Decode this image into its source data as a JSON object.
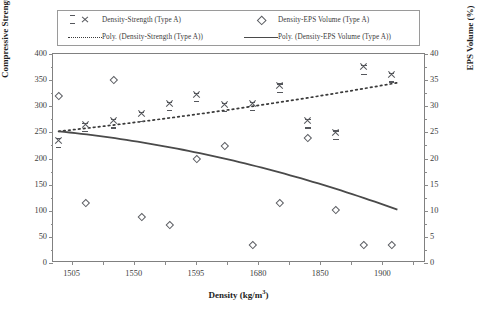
{
  "legend": {
    "entries": [
      {
        "symbol": "x-marker",
        "label": "Density-Strength (Type A)"
      },
      {
        "symbol": "diamond-marker",
        "label": "Density-EPS Volume (Type A)"
      },
      {
        "symbol": "dotted-line",
        "label": "Poly. (Density-Strength (Type A))"
      },
      {
        "symbol": "solid-line",
        "label": "Poly. (Density-EPS Volume (Type A))"
      }
    ]
  },
  "axes": {
    "left_title_main": "Compressive Strength (kg/cm",
    "left_title_sup": "2",
    "left_title_tail": ")",
    "right_title": "EPS Volume (%)",
    "x_title_main": "Density (kg/m",
    "x_title_sup": "3",
    "x_title_tail": ")",
    "left_ticks": [
      "0",
      "50",
      "100",
      "150",
      "200",
      "250",
      "300",
      "350",
      "400"
    ],
    "right_ticks": [
      "0",
      "5",
      "10",
      "15",
      "20",
      "25",
      "30",
      "35",
      "40"
    ],
    "x_tick_labels": [
      "1505",
      "1550",
      "1595",
      "1680",
      "1850",
      "1900"
    ]
  },
  "chart_data": {
    "type": "scatter",
    "title": "",
    "xlabel": "Density (kg/m3)",
    "ylabel": "Compressive Strength (kg/cm2)",
    "y2label": "EPS Volume (%)",
    "xlim": [
      0,
      12
    ],
    "ylim": [
      0,
      400
    ],
    "y2lim": [
      0,
      40
    ],
    "grid": false,
    "legend_position": "top",
    "x_categories": [
      "1505",
      "1520",
      "1550",
      "1565",
      "1595",
      "1625",
      "1680",
      "1750",
      "1850",
      "1875",
      "1900",
      "1930"
    ],
    "x_tick_labels_shown": [
      "1505",
      "1550",
      "1595",
      "1680",
      "1850",
      "1900"
    ],
    "series": [
      {
        "name": "Density-Strength (Type A)",
        "marker": "x-marker",
        "axis": "left",
        "x": [
          0.18,
          1.04,
          1.95,
          2.85,
          3.75,
          4.62,
          5.52,
          6.42,
          7.3,
          8.2,
          9.1,
          10.0
        ],
        "values": [
          235,
          265,
          272,
          285,
          305,
          322,
          303,
          305,
          340,
          272,
          250,
          375
        ],
        "values_secondary_at_10_9": [
          360
        ]
      },
      {
        "name": "Density-EPS Volume (Type A)",
        "marker": "diamond-marker",
        "axis": "right",
        "x": [
          0.18,
          1.04,
          1.95,
          2.85,
          3.75,
          4.62,
          5.52,
          6.42,
          7.3,
          8.2,
          9.1,
          10.0
        ],
        "values": [
          32.0,
          11.5,
          35.0,
          8.8,
          7.3,
          20.0,
          22.5,
          3.5,
          11.5,
          24.0,
          10.2,
          3.5
        ]
      },
      {
        "name": "Poly. (Density-Strength (Type A))",
        "style": "dotted",
        "axis": "left",
        "trend_from": 252,
        "trend_to": 345
      },
      {
        "name": "Poly. (Density-EPS Volume (Type A))",
        "style": "solid",
        "axis": "right",
        "trend_from": 25.2,
        "trend_to": 10.2
      }
    ]
  }
}
